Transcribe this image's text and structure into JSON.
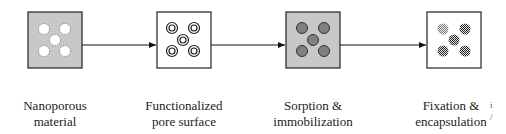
{
  "diagram": {
    "steps": [
      {
        "id": "nanoporous",
        "label_line1": "Nanoporous",
        "label_line2": "material",
        "box_fill": "#c8c8c8",
        "pore_style": "empty-white"
      },
      {
        "id": "functionalized",
        "label_line1": "Functionalized",
        "label_line2": "pore surface",
        "box_fill": "#ffffff",
        "pore_style": "concentric-rings"
      },
      {
        "id": "sorption",
        "label_line1": "Sorption &",
        "label_line2": "immobilization",
        "box_fill": "#c8c8c8",
        "pore_style": "filled-gray"
      },
      {
        "id": "fixation",
        "label_line1": "Fixation &",
        "label_line2": "encapsulation",
        "box_fill": "#ffffff",
        "pore_style": "checkered"
      }
    ],
    "edge_marks": {
      "top": "i",
      "bottom": "/"
    }
  }
}
